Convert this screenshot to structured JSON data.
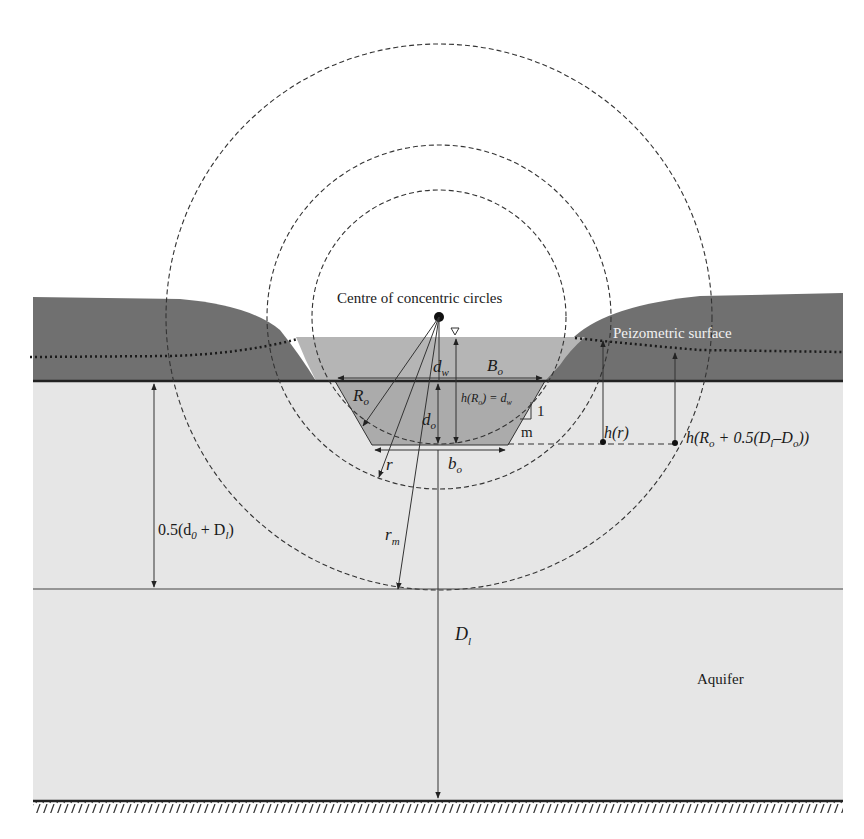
{
  "diagram": {
    "type": "cross-section",
    "colors": {
      "background": "#ffffff",
      "aquifer": "#e6e6e6",
      "confining_layer": "#6f6f6f",
      "water": "#b3b3b3",
      "line": "#2a2a2a",
      "peizometric_text": "#f0f0f0"
    },
    "labels": {
      "centre": "Centre of concentric circles",
      "peizometric": "Peizometric surface",
      "aquifer": "Aquifer",
      "dw": "d",
      "dw_sub": "w",
      "Bo": "B",
      "Bo_sub": "o",
      "Ro": "R",
      "Ro_sub": "o",
      "hRo_a": "h(R",
      "hRo_sub": "o",
      "hRo_b": ") = d",
      "hRo_sub2": "w",
      "slope_1": "1",
      "slope_m": "m",
      "do": "d",
      "do_sub": "o",
      "r": "r",
      "bo": "b",
      "bo_sub": "o",
      "hr": "h(r)",
      "hR_a": "h(R",
      "hR_sub1": "o",
      "hR_b": " + 0.5(D",
      "hR_sub2": "l",
      "hR_c": "–D",
      "hR_sub3": "o",
      "hR_d": "))",
      "half_a": "0.5(d",
      "half_sub1": "0",
      "half_b": " + D",
      "half_sub2": "l",
      "half_c": ")",
      "rm": "r",
      "rm_sub": "m",
      "Dl": "D",
      "Dl_sub": "l"
    },
    "circles": [
      {
        "name": "outer",
        "cx": 439,
        "cy": 317,
        "r": 273
      },
      {
        "name": "middle",
        "cx": 439,
        "cy": 317,
        "r": 172
      },
      {
        "name": "inner",
        "cx": 439,
        "cy": 317,
        "r": 127
      }
    ]
  }
}
